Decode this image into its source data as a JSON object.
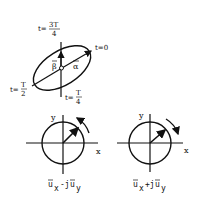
{
  "ellipse_diagram": {
    "labels": {
      "t_3T4_prefix": "t=",
      "t_3T4_num": "3T",
      "t_3T4_den": "4",
      "t0": "t=0",
      "tT2_prefix": "t=",
      "tT2_num": "T",
      "tT2_den": "2",
      "tT4_prefix": "t=",
      "tT4_num": "T",
      "tT4_den": "4",
      "beta": "β",
      "alpha": "α"
    }
  },
  "circle_left": {
    "y_label": "y",
    "x_label": "x",
    "rotation": "counter-clockwise",
    "caption_a": "u",
    "caption_a_sub": "x",
    "caption_op": "-j",
    "caption_b": "u",
    "caption_b_sub": "y"
  },
  "circle_right": {
    "y_label": "y",
    "x_label": "x",
    "rotation": "clockwise",
    "caption_a": "u",
    "caption_a_sub": "x",
    "caption_op": "+j",
    "caption_b": "u",
    "caption_b_sub": "y"
  },
  "colors": {
    "ink": "#111111",
    "background": "#ffffff"
  }
}
